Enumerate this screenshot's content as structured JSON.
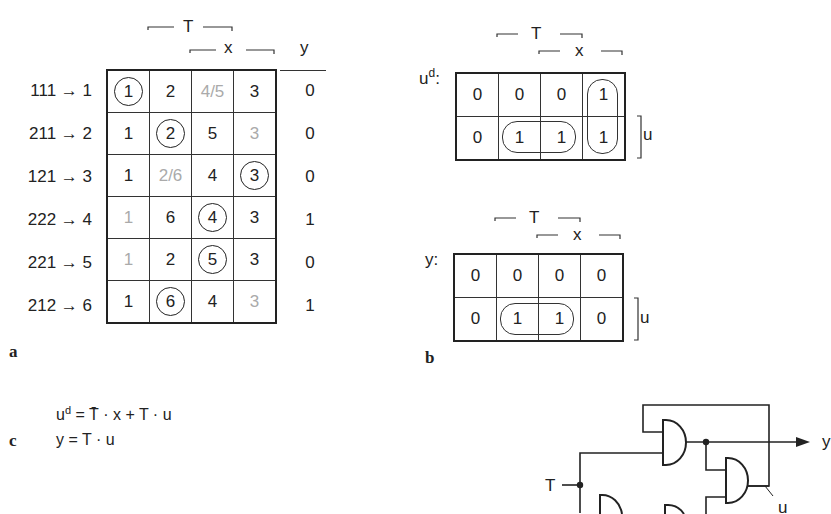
{
  "figure": {
    "panel_a": {
      "label": "a",
      "header": {
        "T": "T",
        "x": "x",
        "y": "y"
      },
      "rows": [
        {
          "label": "111 → 1",
          "cells": [
            {
              "v": "1",
              "style": "circled"
            },
            {
              "v": "2",
              "style": "normal"
            },
            {
              "v": "4/5",
              "style": "gray"
            },
            {
              "v": "3",
              "style": "normal"
            }
          ],
          "y": "0"
        },
        {
          "label": "211 → 2",
          "cells": [
            {
              "v": "1",
              "style": "normal"
            },
            {
              "v": "2",
              "style": "circled"
            },
            {
              "v": "5",
              "style": "normal"
            },
            {
              "v": "3",
              "style": "gray"
            }
          ],
          "y": "0"
        },
        {
          "label": "121 → 3",
          "cells": [
            {
              "v": "1",
              "style": "normal"
            },
            {
              "v": "2/6",
              "style": "gray"
            },
            {
              "v": "4",
              "style": "normal"
            },
            {
              "v": "3",
              "style": "circled"
            }
          ],
          "y": "0"
        },
        {
          "label": "222 → 4",
          "cells": [
            {
              "v": "1",
              "style": "gray"
            },
            {
              "v": "6",
              "style": "normal"
            },
            {
              "v": "4",
              "style": "circled"
            },
            {
              "v": "3",
              "style": "normal"
            }
          ],
          "y": "1"
        },
        {
          "label": "221 → 5",
          "cells": [
            {
              "v": "1",
              "style": "gray"
            },
            {
              "v": "2",
              "style": "normal"
            },
            {
              "v": "5",
              "style": "circled"
            },
            {
              "v": "3",
              "style": "normal"
            }
          ],
          "y": "0"
        },
        {
          "label": "212 → 6",
          "cells": [
            {
              "v": "1",
              "style": "normal"
            },
            {
              "v": "6",
              "style": "circled"
            },
            {
              "v": "4",
              "style": "normal"
            },
            {
              "v": "3",
              "style": "gray"
            }
          ],
          "y": "1"
        }
      ]
    },
    "panel_b": {
      "label": "b",
      "kmaps": [
        {
          "name": "ud",
          "title_base": "u",
          "title_sup": "d",
          "title_suffix": ":",
          "header": {
            "T": "T",
            "x": "x"
          },
          "side": "u",
          "cells": [
            [
              "0",
              "0",
              "0",
              "1"
            ],
            [
              "0",
              "1",
              "1",
              "1"
            ]
          ],
          "groups": [
            "row2 col2-3",
            "col4 row1-2"
          ]
        },
        {
          "name": "y",
          "title_base": "y",
          "title_sup": "",
          "title_suffix": ":",
          "header": {
            "T": "T",
            "x": "x"
          },
          "side": "u",
          "cells": [
            [
              "0",
              "0",
              "0",
              "0"
            ],
            [
              "0",
              "1",
              "1",
              "0"
            ]
          ],
          "groups": [
            "row2 col2-3"
          ]
        }
      ]
    },
    "panel_c": {
      "label": "c",
      "equations": [
        {
          "lhs_base": "u",
          "lhs_sup": "d",
          "rhs_parts": [
            "=",
            "T̄",
            "· x + T · u"
          ]
        },
        {
          "lhs_base": "y",
          "lhs_sup": "",
          "rhs_parts": [
            "=",
            "T",
            "· u"
          ]
        }
      ]
    },
    "circuit": {
      "input_label": "T",
      "output_label": "y",
      "feedback_label": "u",
      "gates": [
        "AND",
        "AND",
        "AND",
        "AND"
      ]
    },
    "colors": {
      "ink": "#222222",
      "gray_text": "#aaaaaa",
      "background": "#ffffff"
    }
  }
}
